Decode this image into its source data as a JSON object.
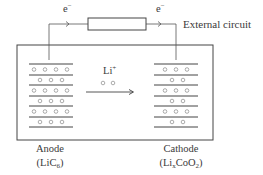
{
  "diagram": {
    "type": "lithium-ion battery discharge schematic",
    "external_circuit": {
      "label": "External circuit",
      "electron_left": {
        "base": "e",
        "sup": "−"
      },
      "electron_right": {
        "base": "e",
        "sup": "−"
      }
    },
    "ion": {
      "base": "Li",
      "sup": "+"
    },
    "anode": {
      "label": "Anode",
      "formula_open": "(LiC",
      "formula_sub": "6",
      "formula_close": ")",
      "layers": 7,
      "ion_rows": [
        4,
        3,
        4,
        3,
        4,
        3
      ]
    },
    "cathode": {
      "label": "Cathode",
      "formula_open": "(Li",
      "formula_sub1": "x",
      "formula_mid": "CoO",
      "formula_sub2": "2",
      "formula_close": ")",
      "layers": 7,
      "ion_rows": [
        3,
        2,
        3,
        2,
        3,
        2
      ]
    },
    "colors": {
      "line": "#444444",
      "ion": "#888888",
      "background": "#ffffff"
    }
  }
}
